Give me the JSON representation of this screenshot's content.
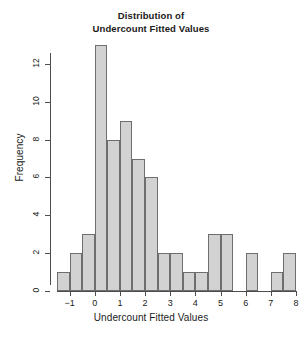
{
  "chart_data": {
    "type": "bar",
    "title": "Distribution of Undercount Fitted Values",
    "title_lines": [
      "Distribution of",
      "Undercount Fitted Values"
    ],
    "xlabel": "Undercount Fitted Values",
    "ylabel": "Frequency",
    "bin_width": 0.5,
    "bin_edges": [
      -1.5,
      -1.0,
      -0.5,
      0.0,
      0.5,
      1.0,
      1.5,
      2.0,
      2.5,
      3.0,
      3.5,
      4.0,
      4.5,
      5.0,
      5.5,
      6.0,
      6.5,
      7.0,
      7.5,
      8.0
    ],
    "categories": [
      "[-1.5,-1.0)",
      "[-1.0,-0.5)",
      "[-0.5,0.0)",
      "[0.0,0.5)",
      "[0.5,1.0)",
      "[1.0,1.5)",
      "[1.5,2.0)",
      "[2.0,2.5)",
      "[2.5,3.0)",
      "[3.0,3.5)",
      "[3.5,4.0)",
      "[4.0,4.5)",
      "[4.5,5.0)",
      "[5.0,5.5)",
      "[5.5,6.0)",
      "[6.0,6.5)",
      "[6.5,7.0)",
      "[7.0,7.5)",
      "[7.5,8.0]"
    ],
    "values": [
      1,
      2,
      3,
      13,
      8,
      9,
      7,
      6,
      2,
      2,
      1,
      1,
      3,
      3,
      0,
      2,
      0,
      1,
      2
    ],
    "xlim": [
      -1.5,
      8.0
    ],
    "ylim": [
      0,
      13
    ],
    "xticks": [
      -1,
      0,
      1,
      2,
      3,
      4,
      5,
      6,
      7,
      8
    ],
    "xticklabels": [
      "−1",
      "0",
      "1",
      "2",
      "3",
      "4",
      "5",
      "6",
      "7",
      "8"
    ],
    "yticks": [
      0,
      2,
      4,
      6,
      8,
      10,
      12
    ],
    "yticklabels": [
      "0",
      "2",
      "4",
      "6",
      "8",
      "10",
      "12"
    ],
    "grid": false,
    "legend": false,
    "bar_fill": "#d2d2d2",
    "bar_border": "#6e6e6e",
    "axis_color": "#4d4d4d",
    "background": "#ffffff"
  }
}
